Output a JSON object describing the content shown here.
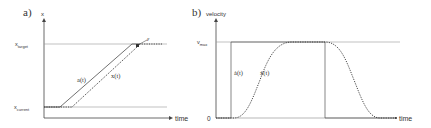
{
  "panel_a": {
    "label": "a)",
    "y_axis_label": "x",
    "x_axis_label": "time",
    "target_label": "x",
    "target_sub": "target",
    "current_label": "x",
    "current_sub": "current",
    "commanded_curve_label": "a(t)",
    "actual_curve_label": "x(t)",
    "epsilon_label": "ε"
  },
  "panel_b": {
    "label": "b)",
    "y_axis_label": "velocity",
    "x_axis_label": "time",
    "vmax_label": "v",
    "vmax_sub": "max",
    "zero_label": "0",
    "commanded_curve_label": "ȧ(t)",
    "actual_curve_label": "ẋ(t)"
  },
  "colors": {
    "axis": "#444444",
    "guide": "#888888",
    "curve": "#333333"
  }
}
